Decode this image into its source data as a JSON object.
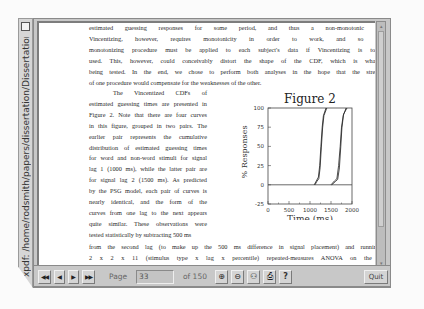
{
  "window": {
    "title": "xpdf: /home/rodsmith/papers/dissertation/Dissertation.pdf"
  },
  "document": {
    "top_lines": [
      "estimated guessing responses for some period, and thus a non-monotonic CDF.",
      "Vincentizing, however, requires monotonicity in order to work, and so some",
      "monotonizing procedure must be applied to each subject's data if Vincentizing is to be",
      "used.  This, however, could conceivably distort the shape of the CDF, which is what is",
      "being tested.  In the end, we chose to perform both analyses in the hope that the strengths",
      "of one procedure would compensate for the weaknesses of the other."
    ],
    "left_column_lines": [
      "The Vincentized CDFs of",
      "estimated guessing times are presented in",
      "Figure 2.  Note that there are four curves",
      "in this figure, grouped in two pairs.  The",
      "earlier pair represents the cumulative",
      "distribution of estimated guessing times",
      "for word and non-word stimuli for signal",
      "lag 1 (1000 ms), while the latter pair are",
      "for signal lag 2 (1500 ms).  As predicted",
      "by the PSG model, each pair of curves is",
      "nearly identical, and the form of the",
      "curves from one lag to the next appears",
      "quite similar.  These observations were",
      "tested statistically by subtracting 500 ms"
    ],
    "bottom_lines": [
      "from the second lag (to make up the 500 ms difference in signal placement) and running a",
      "2 x 2 x 11 (stimulus type x lag x percentile) repeated-measures ANOVA on the RTs",
      "associated with every tenth percentile from 0 to 100, inclusive.  The results indicate a"
    ]
  },
  "chart_data": {
    "type": "line",
    "title": "Figure 2",
    "xlabel": "Time (ms)",
    "ylabel": "% Responses",
    "xlim": [
      0,
      2000
    ],
    "ylim": [
      -25,
      100
    ],
    "x_ticks": [
      "0",
      "500",
      "1000",
      "1500",
      "2000"
    ],
    "y_ticks": [
      "-25",
      "0",
      "25",
      "50",
      "75",
      "100"
    ],
    "grid": false,
    "legend": null,
    "series": [
      {
        "name": "lag 1 word",
        "x": [
          1100,
          1150,
          1200,
          1230,
          1260,
          1290,
          1320,
          1380
        ],
        "y": [
          0,
          5,
          10,
          25,
          50,
          75,
          90,
          100
        ]
      },
      {
        "name": "lag 1 non-word",
        "x": [
          1120,
          1160,
          1210,
          1240,
          1270,
          1300,
          1330,
          1400
        ],
        "y": [
          0,
          4,
          8,
          22,
          48,
          74,
          90,
          100
        ]
      },
      {
        "name": "lag 2 word",
        "x": [
          1500,
          1580,
          1640,
          1680,
          1720,
          1750,
          1790,
          1860
        ],
        "y": [
          0,
          5,
          8,
          25,
          50,
          75,
          90,
          100
        ]
      },
      {
        "name": "lag 2 non-word",
        "x": [
          1520,
          1600,
          1660,
          1700,
          1730,
          1760,
          1800,
          1880
        ],
        "y": [
          0,
          4,
          7,
          22,
          48,
          74,
          92,
          100
        ]
      }
    ]
  },
  "toolbar": {
    "first_page": "◀◀",
    "prev_page": "◀",
    "next_page": "▶",
    "last_page": "▶▶",
    "page_label": "Page",
    "page_value": "33",
    "of_label": "of 150",
    "zoom_in": "⊕",
    "zoom_out": "⊖",
    "find": "⚇",
    "print": "⎙",
    "help": "?",
    "quit": "Quit"
  }
}
